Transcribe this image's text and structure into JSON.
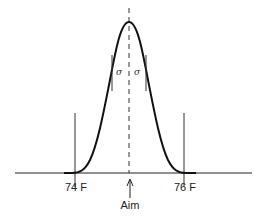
{
  "diagram": {
    "type": "normal-distribution",
    "labels": {
      "lower_spec": "74 F",
      "upper_spec": "76 F",
      "aim": "Aim",
      "sigma_left": "σ",
      "sigma_right": "σ"
    },
    "colors": {
      "stroke": "#111111",
      "background": "#ffffff"
    }
  }
}
